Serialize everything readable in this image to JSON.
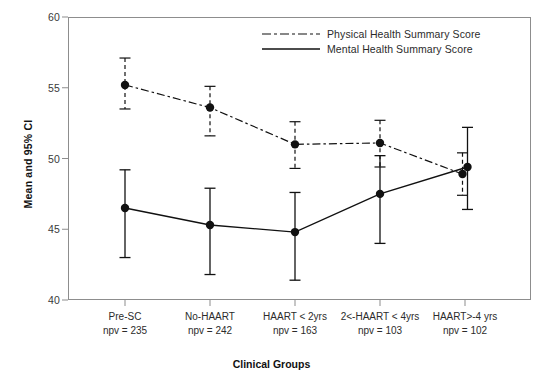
{
  "chart_data": {
    "type": "line",
    "title": "",
    "xlabel": "Clinical Groups",
    "ylabel": "Mean and 95% CI",
    "ylim": [
      40,
      60
    ],
    "yticks": [
      40,
      45,
      50,
      55,
      60
    ],
    "ytick_labels": [
      "40",
      "45",
      "50",
      "55",
      "60"
    ],
    "grid": false,
    "legend_position": "top-center",
    "categories": [
      "Pre-SC",
      "No-HAART",
      "HAART < 2yrs",
      "2<-HAART < 4yrs",
      "HAART>-4 yrs"
    ],
    "category_sublabels": [
      "npv = 235",
      "npv = 242",
      "npv = 163",
      "npv = 103",
      "npv = 102"
    ],
    "series": [
      {
        "name": "Physical Health Summary Score",
        "style": "dash-dot",
        "marker": "filled-circle",
        "values": [
          55.2,
          53.6,
          51.0,
          51.1,
          48.9
        ],
        "ci_lower": [
          53.5,
          51.6,
          49.3,
          49.4,
          47.4
        ],
        "ci_upper": [
          57.1,
          55.1,
          52.6,
          52.7,
          50.4
        ]
      },
      {
        "name": "Mental Health Summary Score",
        "style": "solid",
        "marker": "filled-circle",
        "values": [
          46.5,
          45.3,
          44.8,
          47.5,
          49.4
        ],
        "ci_lower": [
          43.0,
          41.8,
          41.4,
          44.0,
          46.4
        ],
        "ci_upper": [
          49.2,
          47.9,
          47.6,
          50.2,
          52.2
        ]
      }
    ]
  },
  "legend": {
    "items": [
      {
        "label": "Physical Health Summary Score",
        "style": "dash-dot"
      },
      {
        "label": "Mental Health Summary Score",
        "style": "solid"
      }
    ]
  },
  "colors": {
    "series_line": "#111111",
    "frame": "#8d8d8d",
    "text": "#1a1a1a"
  }
}
